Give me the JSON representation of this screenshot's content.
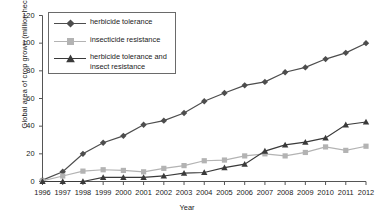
{
  "chart_data": {
    "type": "line",
    "title": "",
    "xlabel": "Year",
    "ylabel": "Global area of crop grown (million hectares)",
    "x": [
      1996,
      1997,
      1998,
      1999,
      2000,
      2001,
      2002,
      2003,
      2004,
      2005,
      2006,
      2007,
      2008,
      2009,
      2010,
      2011,
      2012
    ],
    "xtick_labels": [
      "1996",
      "1997",
      "1998",
      "1999",
      "2000",
      "2001",
      "2002",
      "2003",
      "2004",
      "2005",
      "2006",
      "2007",
      "2008",
      "2009",
      "2010",
      "2011",
      "2012"
    ],
    "ytick_labels": [
      "0",
      "20",
      "40",
      "60",
      "80",
      "100",
      "120"
    ],
    "yticks": [
      0,
      20,
      40,
      60,
      80,
      100,
      120
    ],
    "ylim": [
      0,
      120
    ],
    "xlim": [
      1996,
      2012
    ],
    "grid": false,
    "legend_position": "upper-left",
    "series": [
      {
        "name": "herbicide tolerance",
        "marker": "diamond",
        "color": "#4d4d4d",
        "values": [
          1,
          7,
          20,
          28,
          33,
          41,
          44,
          49.5,
          58,
          64,
          69.5,
          72,
          79,
          82.5,
          88.5,
          93,
          100
        ]
      },
      {
        "name": "insecticide resistance",
        "marker": "square",
        "color": "#b3b3b3",
        "values": [
          0.5,
          4,
          7.5,
          8.5,
          8,
          7,
          9.5,
          11.5,
          15,
          15.5,
          18.5,
          20,
          18.5,
          21,
          25,
          22.5,
          25.5
        ]
      },
      {
        "name": "herbicide tolerance and insect resistance",
        "marker": "triangle",
        "color": "#3a3a3a",
        "values": [
          0,
          0,
          0,
          3,
          3,
          3,
          4,
          6,
          6.5,
          10,
          12.5,
          22,
          26.5,
          28.5,
          31.5,
          41,
          43
        ]
      }
    ]
  },
  "legend": {
    "items": [
      {
        "label_line1": "herbicide tolerance",
        "label_line2": ""
      },
      {
        "label_line1": "insecticide resistance",
        "label_line2": ""
      },
      {
        "label_line1": "herbicide tolerance and",
        "label_line2": "insect resistance"
      }
    ]
  },
  "colors": {
    "series_dark": "#4d4d4d",
    "series_light": "#b3b3b3",
    "series_triangle": "#3a3a3a",
    "axis": "#555555",
    "text": "#1a1a1a"
  }
}
